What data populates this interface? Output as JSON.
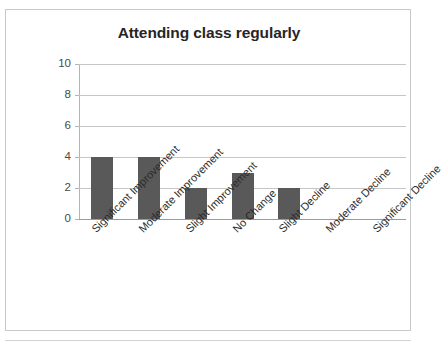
{
  "chart_data": {
    "type": "bar",
    "title": "Attending class regularly",
    "xlabel": "",
    "ylabel": "",
    "categories": [
      "Significant Improvement",
      "Moderate Improvement",
      "Slight Improvement",
      "No Change",
      "Slight Decline",
      "Moderate Decline",
      "Significant Decline"
    ],
    "values": [
      4,
      4,
      2,
      3,
      2,
      0,
      0
    ],
    "ylim": [
      0,
      10
    ],
    "yticks": [
      0,
      2,
      4,
      6,
      8,
      10
    ],
    "ytick_labels": [
      "0",
      "2",
      "4",
      "6",
      "8",
      "10"
    ],
    "grid": true,
    "legend": false,
    "bar_color": "#595959",
    "gridline_color": "#c6c6c6",
    "title_color": "#262626",
    "tick_label_color": "#4a4a4a",
    "category_label_rotation": -45
  }
}
